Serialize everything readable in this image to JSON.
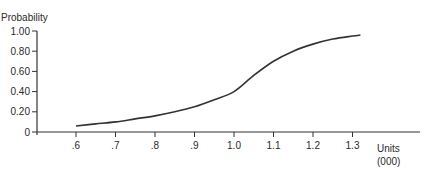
{
  "chart_data": {
    "type": "line",
    "title": "",
    "ylabel": "Probability",
    "xlabel": "Units",
    "xlabel_sub": "(000)",
    "x_ticks": [
      ".6",
      ".7",
      ".8",
      ".9",
      "1.0",
      "1.1",
      "1.2",
      "1.3"
    ],
    "x_tick_values": [
      0.6,
      0.7,
      0.8,
      0.9,
      1.0,
      1.1,
      1.2,
      1.3
    ],
    "y_ticks": [
      "0",
      "0.20",
      "0.40",
      "0.60",
      "0.80",
      "1.00"
    ],
    "y_tick_values": [
      0,
      0.2,
      0.4,
      0.6,
      0.8,
      1.0
    ],
    "xlim": [
      0.5,
      1.5
    ],
    "ylim": [
      0,
      1.0
    ],
    "grid": false,
    "legend": null,
    "series": [
      {
        "name": "Cumulative probability",
        "x": [
          0.6,
          0.65,
          0.7,
          0.75,
          0.8,
          0.85,
          0.9,
          0.95,
          1.0,
          1.05,
          1.1,
          1.15,
          1.2,
          1.25,
          1.3,
          1.32
        ],
        "y": [
          0.06,
          0.08,
          0.1,
          0.13,
          0.16,
          0.2,
          0.25,
          0.32,
          0.4,
          0.56,
          0.7,
          0.8,
          0.87,
          0.92,
          0.95,
          0.96
        ]
      }
    ]
  }
}
